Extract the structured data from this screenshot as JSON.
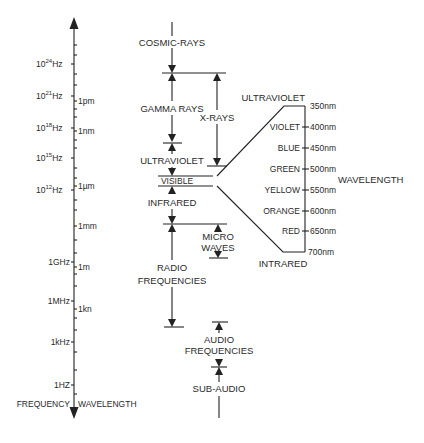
{
  "axis": {
    "frequency_title": "FREQUENCY",
    "wavelength_title": "WAVELENGTH",
    "frequency_labels": [
      {
        "base": "10",
        "exp": "24",
        "unit": "Hz"
      },
      {
        "base": "10",
        "exp": "21",
        "unit": "Hz"
      },
      {
        "base": "10",
        "exp": "18",
        "unit": "Hz"
      },
      {
        "base": "10",
        "exp": "15",
        "unit": "Hz"
      },
      {
        "base": "10",
        "exp": "12",
        "unit": "Hz"
      },
      {
        "text": "1GHz"
      },
      {
        "text": "1MHz"
      },
      {
        "text": "1kHz"
      },
      {
        "text": "1HZ"
      }
    ],
    "wavelength_labels": [
      "1pm",
      "1nm",
      "1µm",
      "1mm",
      "1m",
      "1kn"
    ]
  },
  "bands": {
    "cosmic": "COSMIC-RAYS",
    "gamma": "GAMMA RAYS",
    "xrays": "X-RAYS",
    "ultraviolet": "ULTRAVIOLET",
    "visible": "VISIBLE",
    "infrared": "INFRARED",
    "micro_1": "MICRO",
    "micro_2": "WAVES",
    "radio_1": "RADIO",
    "radio_2": "FREQUENCIES",
    "audio_1": "AUDIO",
    "audio_2": "FREQUENCIES",
    "subaudio": "SUB-AUDIO"
  },
  "visible_detail": {
    "top_label": "ULTRAVIOLET",
    "bottom_label": "INTRARED",
    "axis_label": "WAVELENGTH",
    "colors": [
      "VIOLET",
      "BLUE",
      "GREEN",
      "YELLOW",
      "ORANGE",
      "RED"
    ],
    "wavelengths": [
      "350nm",
      "400nm",
      "450nm",
      "500nm",
      "550nm",
      "600nm",
      "650nm",
      "700nm"
    ]
  }
}
